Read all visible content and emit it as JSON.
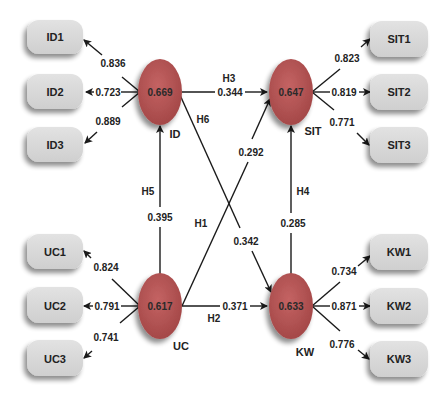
{
  "colors": {
    "construct_fill": "#b65555",
    "indicator_fill": "#d8d8d8",
    "line": "#1a1a1a",
    "background": "#ffffff"
  },
  "constructs": [
    {
      "id": "ID",
      "label": "ID",
      "r2": "0.669"
    },
    {
      "id": "SIT",
      "label": "SIT",
      "r2": "0.647"
    },
    {
      "id": "UC",
      "label": "UC",
      "r2": "0.617"
    },
    {
      "id": "KW",
      "label": "KW",
      "r2": "0.633"
    }
  ],
  "indicators": {
    "ID": [
      {
        "label": "ID1",
        "loading": "0.836"
      },
      {
        "label": "ID2",
        "loading": "0.723"
      },
      {
        "label": "ID3",
        "loading": "0.889"
      }
    ],
    "SIT": [
      {
        "label": "SIT1",
        "loading": "0.823"
      },
      {
        "label": "SIT2",
        "loading": "0.819"
      },
      {
        "label": "SIT3",
        "loading": "0.771"
      }
    ],
    "UC": [
      {
        "label": "UC1",
        "loading": "0.824"
      },
      {
        "label": "UC2",
        "loading": "0.791"
      },
      {
        "label": "UC3",
        "loading": "0.741"
      }
    ],
    "KW": [
      {
        "label": "KW1",
        "loading": "0.734"
      },
      {
        "label": "KW2",
        "loading": "0.871"
      },
      {
        "label": "KW3",
        "loading": "0.776"
      }
    ]
  },
  "paths": [
    {
      "hypothesis": "H1",
      "from": "UC",
      "to": "SIT",
      "coefficient": "0.292"
    },
    {
      "hypothesis": "H2",
      "from": "UC",
      "to": "KW",
      "coefficient": "0.371"
    },
    {
      "hypothesis": "H3",
      "from": "ID",
      "to": "SIT",
      "coefficient": "0.344"
    },
    {
      "hypothesis": "H4",
      "from": "KW",
      "to": "SIT",
      "coefficient": "0.285"
    },
    {
      "hypothesis": "H5",
      "from": "UC",
      "to": "ID",
      "coefficient": "0.395"
    },
    {
      "hypothesis": "H6",
      "from": "ID",
      "to": "KW",
      "coefficient": "0.342"
    }
  ]
}
